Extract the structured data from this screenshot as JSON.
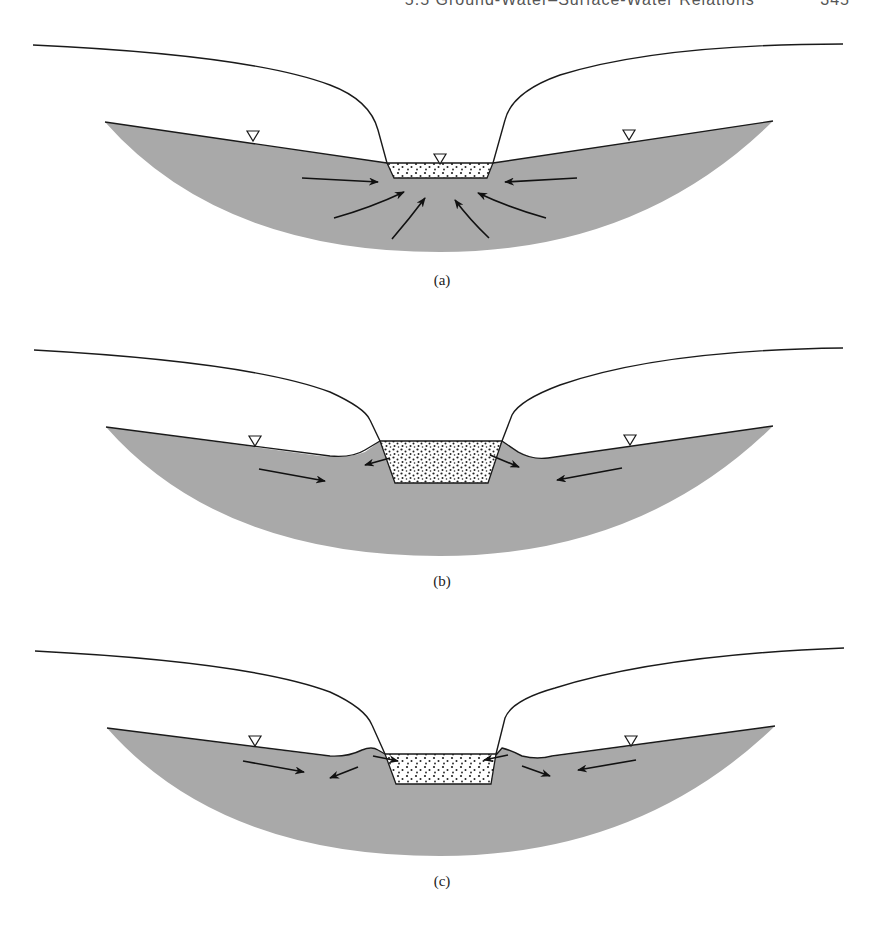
{
  "header": {
    "section_title": "5.5  Ground-Water–Surface-Water Relations",
    "page_number": "345"
  },
  "figure": {
    "colors": {
      "aquifer_fill": "#a9a9a9",
      "water_fill": "#ffffff",
      "line": "#1a1a1a"
    },
    "panels": [
      {
        "label": "(a)",
        "condition": "gaining stream — flow toward channel",
        "water_table_symbols": 3
      },
      {
        "label": "(b)",
        "condition": "flood stage — bank storage, flow away from channel",
        "water_table_symbols": 2
      },
      {
        "label": "(c)",
        "condition": "receding stage — bank storage returning to channel",
        "water_table_symbols": 2
      }
    ]
  }
}
